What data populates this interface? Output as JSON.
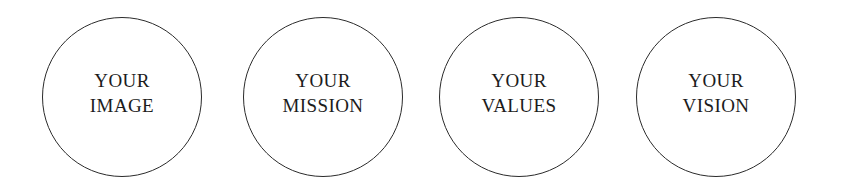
{
  "graphic": {
    "type": "four-circle-outline-diagram",
    "background_color": "#ffffff",
    "stroke_color": "#2b2b2b",
    "text_color": "#1c1c1c",
    "circles": [
      {
        "name": "image",
        "line1": "YOUR",
        "line2": "IMAGE"
      },
      {
        "name": "mission",
        "line1": "YOUR",
        "line2": "MISSION"
      },
      {
        "name": "values",
        "line1": "YOUR",
        "line2": "VALUES"
      },
      {
        "name": "vision",
        "line1": "YOUR",
        "line2": "VISION"
      }
    ]
  }
}
